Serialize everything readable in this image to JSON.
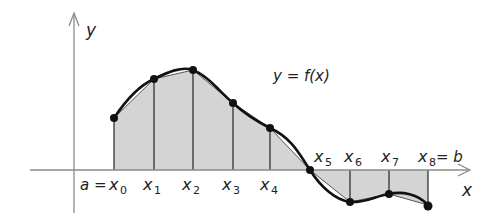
{
  "figure": {
    "function_label": "y = f(x)",
    "axis_labels": {
      "x": "x",
      "y": "y"
    },
    "colors": {
      "fill": "#d4d4d4",
      "curve": "#111111",
      "axis": "#8a8a8a",
      "chord": "#555555"
    },
    "partition": [
      {
        "label": "x",
        "sub": "0",
        "prefix": "a = ",
        "suffix": ""
      },
      {
        "label": "x",
        "sub": "1",
        "prefix": "",
        "suffix": ""
      },
      {
        "label": "x",
        "sub": "2",
        "prefix": "",
        "suffix": ""
      },
      {
        "label": "x",
        "sub": "3",
        "prefix": "",
        "suffix": ""
      },
      {
        "label": "x",
        "sub": "4",
        "prefix": "",
        "suffix": ""
      },
      {
        "label": "x",
        "sub": "5",
        "prefix": "",
        "suffix": ""
      },
      {
        "label": "x",
        "sub": "6",
        "prefix": "",
        "suffix": ""
      },
      {
        "label": "x",
        "sub": "7",
        "prefix": "",
        "suffix": ""
      },
      {
        "label": "x",
        "sub": "8",
        "prefix": "",
        "suffix": " = b"
      }
    ]
  }
}
